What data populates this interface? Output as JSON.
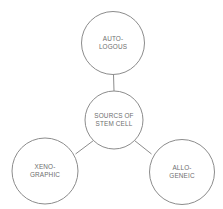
{
  "diagram": {
    "type": "hub-and-spoke",
    "background_color": "#ffffff",
    "stroke_color": "#8c8c8c",
    "text_color": "#6e6e6e",
    "center_node": {
      "id": "sources-of-stem-cell",
      "line1": "SOURCS OF",
      "line2": "STEM CELL",
      "cx": 114,
      "cy": 120,
      "r": 29
    },
    "nodes": [
      {
        "id": "autologous",
        "line1": "AUTO-",
        "line2": "LOGOUS",
        "cx": 113,
        "cy": 43,
        "r": 31.5
      },
      {
        "id": "xenographic",
        "line1": "XENO-",
        "line2": "GRAPHIC",
        "cx": 45,
        "cy": 171,
        "r": 33
      },
      {
        "id": "allogeneic",
        "line1": "ALLO-",
        "line2": "GENEIC",
        "cx": 182,
        "cy": 172,
        "r": 32.5
      }
    ],
    "connectors": [
      {
        "id": "center-to-autologous",
        "x1": 113.5,
        "y1": 74.5,
        "x2": 114,
        "y2": 91
      },
      {
        "id": "center-to-xenographic",
        "x1": 93.5,
        "y1": 140.5,
        "x2": 75.5,
        "y2": 154
      },
      {
        "id": "center-to-allogeneic",
        "x1": 134.5,
        "y1": 140.5,
        "x2": 151.5,
        "y2": 154
      }
    ]
  }
}
